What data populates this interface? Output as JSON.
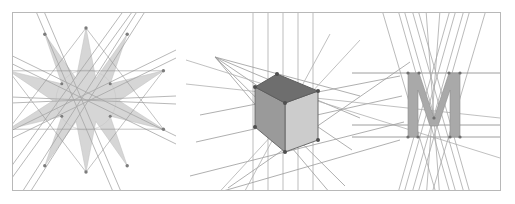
{
  "figure": {
    "title": "Three geometric constructions with projection lines",
    "canvas": {
      "width": 515,
      "height": 204,
      "background": "#ffffff"
    },
    "frame": {
      "label": "outer-frame",
      "x": 12.5,
      "y": 12.5,
      "width": 488,
      "height": 178,
      "stroke": "#b8b8b8",
      "stroke_width": 1,
      "fill": "#ffffff"
    },
    "colors": {
      "frame_border": "#b8b8b8",
      "star_fill": "#d6d6d6",
      "star_stroke": "#a8a8a8",
      "construction_line_light": "#cfcfcf",
      "construction_line_mid": "#a0a0a0",
      "construction_line_dark": "#8a8a8a",
      "grid_line": "#b5b5b5",
      "cube_top": "#6e6e6e",
      "cube_left": "#9a9a9a",
      "cube_right": "#cccccc",
      "cube_edge": "#6a6a6a",
      "vertex_dot": "#555555",
      "letter_fill": "#a9a9a9",
      "letter_stroke": "#8f8f8f",
      "baseline_rule": "#9e9e9e"
    },
    "panels": [
      {
        "id": "panel-star",
        "name": "nine-pointed-star-panel",
        "caption": "",
        "shape_type": "star-polygon",
        "points": 9,
        "center": {
          "x": 86,
          "y": 100
        },
        "outer_radius": 72,
        "inner_radius": 30,
        "rotation_deg": -90,
        "fill": "#d6d6d6",
        "construction_lines": 12,
        "description": "Nine-pointed star polygon filled light grey, overlaid by straight construction lines that extend past the frame edges."
      },
      {
        "id": "panel-cube",
        "name": "isometric-cube-panel",
        "caption": "",
        "shape_type": "cube-two-point-perspective",
        "center": {
          "x": 285,
          "y": 102
        },
        "vanishing_point_left": {
          "x": 215,
          "y": 57
        },
        "vanishing_point_right": {
          "x": 505,
          "y": 80
        },
        "vertical_grid_lines": [
          253,
          268,
          283,
          298,
          313
        ],
        "faces": [
          {
            "name": "top-face",
            "fill": "#6e6e6e"
          },
          {
            "name": "left-face",
            "fill": "#9a9a9a"
          },
          {
            "name": "right-face",
            "fill": "#cccccc"
          }
        ],
        "vertex_count": 7,
        "description": "Shaded cube drawn in two-point perspective with converging projector lines and vertical guide lines."
      },
      {
        "id": "panel-letter",
        "name": "letter-m-panel",
        "caption": "",
        "shape_type": "letterform",
        "glyph": "M",
        "bounds": {
          "x": 408,
          "y": 73,
          "width": 52,
          "height": 64
        },
        "fill": "#a9a9a9",
        "horizontal_rules": [
          73,
          125,
          137
        ],
        "rule_extent": {
          "x1": 352,
          "x2": 500
        },
        "construction_lines": 12,
        "description": "Capital letter M filled grey, with cap-height, mid and baseline rules plus crossing construction lines."
      }
    ]
  }
}
